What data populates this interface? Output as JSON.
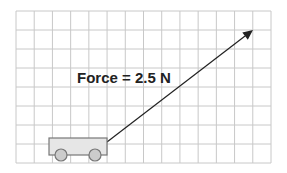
{
  "diagram": {
    "label": "Force = 2.5 N",
    "grid": {
      "x0": 16,
      "y0": 11,
      "x1": 271,
      "y1": 163,
      "cols": 14,
      "rows": 8,
      "color": "#c8c8c8"
    },
    "cart": {
      "x": 49,
      "y": 138,
      "w": 58,
      "h": 17,
      "fill": "#e6e6e6",
      "stroke": "#777777",
      "wheels": [
        {
          "cx": 61,
          "cy": 155,
          "r": 6
        },
        {
          "cx": 95,
          "cy": 155,
          "r": 6
        }
      ],
      "wheel_fill": "#cccccc"
    },
    "arrow": {
      "x1": 107,
      "y1": 142,
      "x2": 253,
      "y2": 30,
      "color": "#222222"
    }
  }
}
